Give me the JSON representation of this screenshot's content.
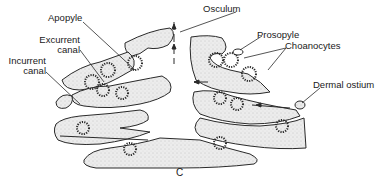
{
  "figure": {
    "panel_label": "C",
    "colors": {
      "stroke": "#2a2a2a",
      "fill": "#e6e6e6",
      "background": "#ffffff"
    }
  },
  "labels": {
    "apopyle": "Apopyle",
    "excurrent": [
      "Excurrent",
      "canal"
    ],
    "incurrent": [
      "Incurrent",
      "canal"
    ],
    "osculum": "Osculum",
    "prosopyle": "Prosopyle",
    "choanocytes": "Choanocytes",
    "dermal_ostium": "Dermal ostium"
  }
}
